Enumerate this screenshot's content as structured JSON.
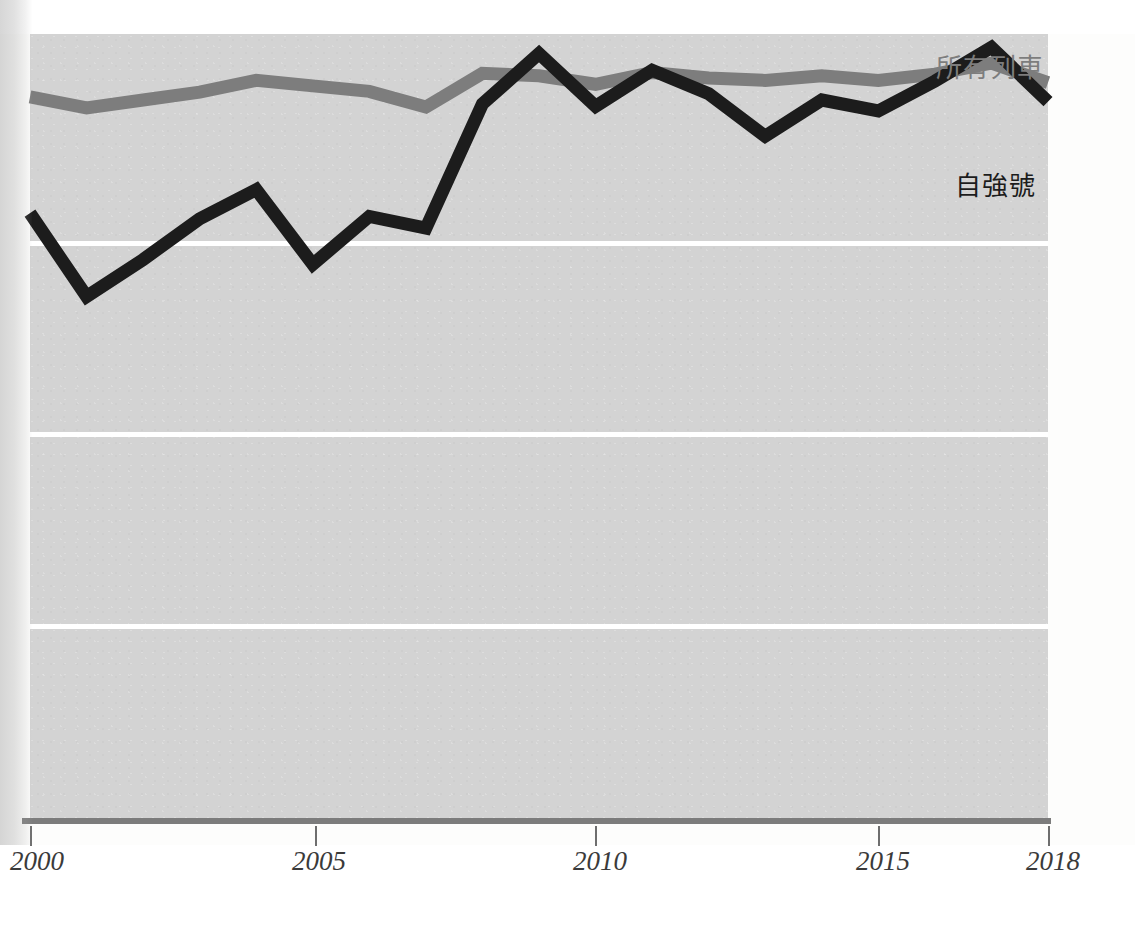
{
  "chart_data": {
    "type": "line",
    "title": "",
    "subtitle": "",
    "xlabel": "",
    "ylabel": "",
    "grid": true,
    "gridlines_horizontal": 3,
    "legend_position": "inline-right",
    "xlim": [
      2000,
      2018
    ],
    "ylim": [
      0,
      100
    ],
    "x": [
      2000,
      2001,
      2002,
      2003,
      2004,
      2005,
      2006,
      2007,
      2008,
      2009,
      2010,
      2011,
      2012,
      2013,
      2014,
      2015,
      2016,
      2017,
      2018
    ],
    "xtick_labels": [
      "2000",
      "2005",
      "2010",
      "2015",
      "2018"
    ],
    "xtick_values": [
      2000,
      2005,
      2010,
      2015,
      2018
    ],
    "series": [
      {
        "name": "所有列車",
        "color": "#7d7d7d",
        "label_text": "所有列車",
        "values": [
          92.0,
          90.6,
          91.6,
          92.6,
          94.1,
          93.4,
          92.7,
          90.7,
          95.0,
          94.7,
          93.6,
          95.1,
          94.4,
          94.1,
          94.7,
          94.1,
          94.9,
          96.3,
          93.8
        ]
      },
      {
        "name": "自強號",
        "color": "#1c1c1c",
        "label_text": "自強號",
        "values": [
          77.2,
          66.6,
          71.3,
          76.5,
          80.2,
          70.7,
          76.8,
          75.3,
          91.1,
          97.5,
          90.8,
          95.4,
          92.4,
          87.0,
          91.6,
          90.2,
          94.0,
          98.3,
          91.4
        ]
      }
    ],
    "legend_entries": [
      {
        "label": "所有列車",
        "color": "#7d7d7d"
      },
      {
        "label": "自強號",
        "color": "#1c1c1c"
      }
    ]
  },
  "axis": {
    "ticks": [
      {
        "label": "2000",
        "x_px": 30
      },
      {
        "label": "2005",
        "x_px": 315
      },
      {
        "label": "2010",
        "x_px": 595
      },
      {
        "label": "2015",
        "x_px": 878
      },
      {
        "label": "2018",
        "x_px": 1048
      }
    ]
  },
  "colors": {
    "plot_background": "#d3d3d3",
    "gridline": "#ffffff",
    "axis_line": "#7c7c7c",
    "all_trains": "#7d7d7d",
    "tzechiang": "#1c1c1c",
    "page_background": "#ffffff"
  }
}
